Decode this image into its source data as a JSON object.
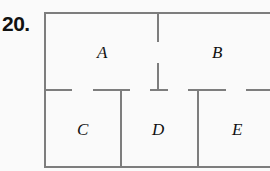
{
  "problem_number": "20.",
  "rooms": [
    {
      "label": "A"
    },
    {
      "label": "B"
    },
    {
      "label": "C"
    },
    {
      "label": "D"
    },
    {
      "label": "E"
    }
  ],
  "colors": {
    "wall": "#7d7d7d",
    "text": "#111111",
    "background": "#fafafa"
  }
}
